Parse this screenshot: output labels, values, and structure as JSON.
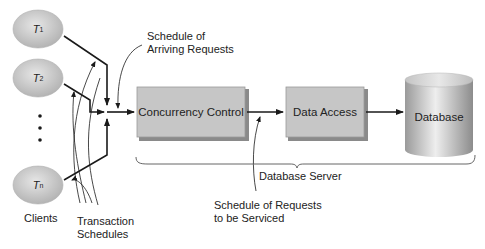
{
  "clients": [
    {
      "label": "T",
      "subscript": "1"
    },
    {
      "label": "T",
      "subscript": "2"
    },
    {
      "label": "T",
      "subscript": "n"
    }
  ],
  "clients_caption": "Clients",
  "ellipsis": "⋮",
  "transaction_schedules_label": [
    "Transaction",
    "Schedules"
  ],
  "arriving_requests_label": [
    "Schedule of",
    "Arriving Requests"
  ],
  "boxes": {
    "concurrency_control": "Concurrency Control",
    "data_access": "Data Access",
    "database": "Database"
  },
  "server_label": "Database Server",
  "serviced_label": [
    "Schedule of Requests",
    "to be Serviced"
  ],
  "colors": {
    "ellipse_fill": "#c8c8c8",
    "box_fill": "#c6c6c6",
    "box_edge": "#8a8a8a",
    "line": "#1a1a1a",
    "text": "#222222"
  }
}
